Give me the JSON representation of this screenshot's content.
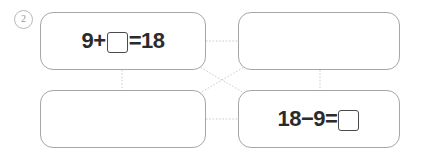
{
  "worksheet": {
    "item_number": "2",
    "background_color": "#ffffff",
    "card_border_color": "#a6a6a6",
    "text_color": "#2b2b2b",
    "connector_color": "#c9c9c9"
  },
  "cards": [
    {
      "id": "card-1",
      "position": "top-left",
      "empty": false,
      "equation": {
        "left_operand": "9",
        "operator": "+",
        "blank_position": "middle",
        "equals": "=",
        "right_operand": "18",
        "text_before_blank": "9+",
        "text_after_blank": "=18",
        "full_text": "9+□=18"
      }
    },
    {
      "id": "card-2",
      "position": "top-right",
      "empty": true,
      "equation": {
        "text_before_blank": "",
        "text_after_blank": "",
        "full_text": ""
      }
    },
    {
      "id": "card-3",
      "position": "bottom-left",
      "empty": true,
      "equation": {
        "text_before_blank": "",
        "text_after_blank": "",
        "full_text": ""
      }
    },
    {
      "id": "card-4",
      "position": "bottom-right",
      "empty": false,
      "equation": {
        "left_operand": "18",
        "operator": "−",
        "blank_position": "end",
        "equals": "=",
        "right_operand": "",
        "text_before_blank": "18−9=",
        "text_after_blank": "",
        "full_text": "18−9=□"
      }
    }
  ],
  "connectors": [
    {
      "name": "top-horizontal",
      "from": "card-1",
      "to": "card-2",
      "style": "dotted"
    },
    {
      "name": "bottom-horizontal",
      "from": "card-3",
      "to": "card-4",
      "style": "dotted"
    },
    {
      "name": "left-vertical",
      "from": "card-1",
      "to": "card-3",
      "style": "dotted"
    },
    {
      "name": "right-vertical",
      "from": "card-2",
      "to": "card-4",
      "style": "dotted"
    },
    {
      "name": "diagonal-down",
      "from": "card-1",
      "to": "card-4",
      "style": "dotted"
    },
    {
      "name": "diagonal-up",
      "from": "card-2",
      "to": "card-3",
      "style": "dotted"
    }
  ]
}
